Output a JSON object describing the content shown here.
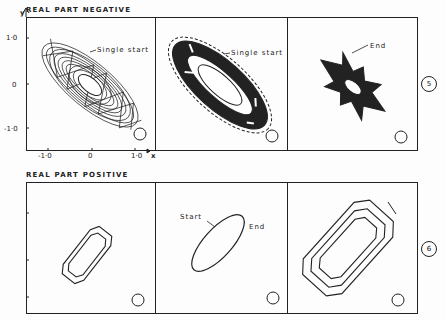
{
  "top_row": {
    "title": "REAL PART NEGATIVE",
    "figure_number": "5",
    "axis": {
      "y_label": "y",
      "x_label": "x",
      "y_ticks": [
        "1·0",
        "0",
        "-1·0"
      ],
      "x_ticks": [
        "-1·0",
        "0",
        "1·0"
      ]
    },
    "panels": [
      {
        "annotation": "Single start"
      },
      {
        "annotation": "Single start"
      },
      {
        "annotation": "End"
      }
    ]
  },
  "bottom_row": {
    "title": "REAL PART POSITIVE",
    "figure_number": "6",
    "panels": [
      {
        "annotation": ""
      },
      {
        "annotation_start": "Start",
        "annotation_end": "End"
      },
      {
        "annotation": ""
      }
    ]
  }
}
